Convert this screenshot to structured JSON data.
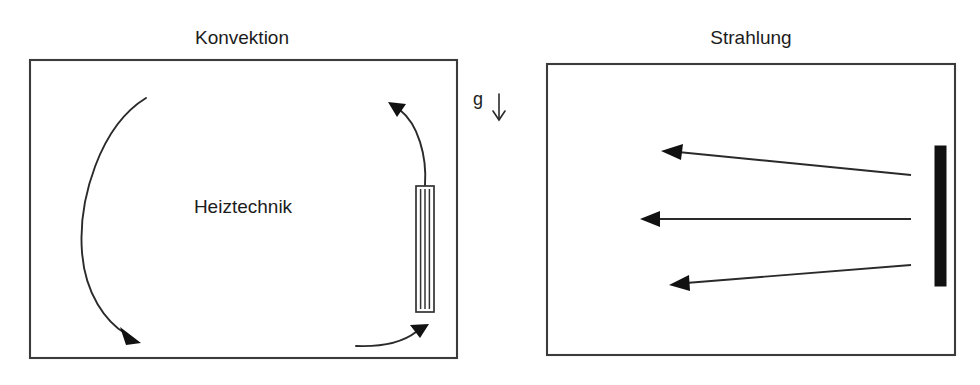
{
  "figure": {
    "type": "diagram",
    "background_color": "#ffffff",
    "line_color": "#2a2a2a",
    "fill_color": "#111111"
  },
  "panels": [
    {
      "id": "konvektion",
      "title": "Konvektion",
      "title_x": 242,
      "title_y": 44,
      "inner_label": "Heiztechnik",
      "inner_label_x": 243,
      "inner_label_y": 213,
      "box": {
        "x": 30,
        "y": 60,
        "width": 427,
        "height": 298
      },
      "heater": {
        "name": "finned-radiator",
        "style": "outlined-with-vertical-fins",
        "x": 416,
        "y": 186,
        "width": 18,
        "height": 126,
        "fin_count": 4
      },
      "flows": [
        {
          "name": "rising-flow-at-radiator",
          "direction": "up-left",
          "arrowhead": "at-top-left"
        },
        {
          "name": "ceiling-to-floor-circulation",
          "direction": "down",
          "arrowhead": "at-bottom"
        },
        {
          "name": "floor-return-flow",
          "direction": "right-up",
          "arrowhead": "at-right"
        }
      ]
    },
    {
      "id": "strahlung",
      "title": "Strahlung",
      "title_x": 751,
      "title_y": 44,
      "inner_label": "",
      "box": {
        "x": 547,
        "y": 64,
        "width": 408,
        "height": 291
      },
      "heater": {
        "name": "flat-radiant-panel",
        "style": "solid-black-bar",
        "x": 935,
        "y": 146,
        "width": 11,
        "height": 140,
        "fin_count": 0
      },
      "rays": [
        {
          "name": "ray-upper",
          "x1": 911,
          "y1": 175,
          "x2": 663,
          "y2": 151
        },
        {
          "name": "ray-middle",
          "x1": 911,
          "y1": 219,
          "x2": 641,
          "y2": 219
        },
        {
          "name": "ray-lower",
          "x1": 911,
          "y1": 265,
          "x2": 670,
          "y2": 285
        }
      ]
    }
  ],
  "gravity": {
    "label": "g",
    "label_x": 478,
    "label_y": 105,
    "arrow_direction": "down",
    "arrow_x": 499,
    "arrow_y_start": 95,
    "arrow_y_end": 121
  }
}
